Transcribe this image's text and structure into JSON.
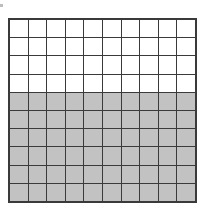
{
  "diagram": {
    "type": "hundred-grid",
    "rows": 10,
    "columns": 10,
    "total_cells": 100,
    "shaded_cells": 60,
    "unshaded_cells": 40,
    "shaded_rows_from_bottom": 6,
    "unshaded_rows_from_top": 4,
    "fraction_shaded": "60/100",
    "colors": {
      "shaded": "#c2c2c2",
      "unshaded": "#ffffff",
      "grid_line": "#3a3a3a"
    }
  }
}
